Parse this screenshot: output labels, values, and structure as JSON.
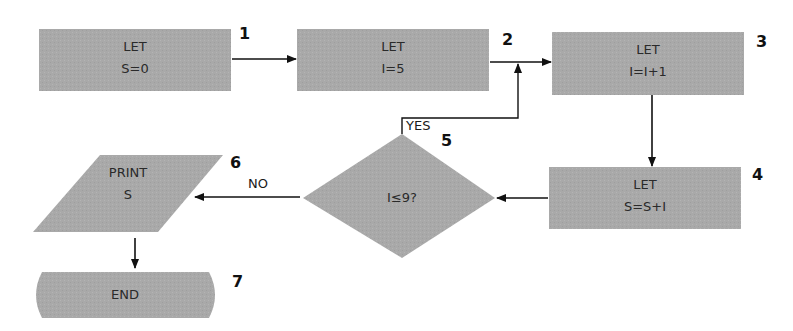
{
  "diagram": {
    "type": "flowchart",
    "fill_color": "#a9a9a9",
    "line_color": "#111111",
    "nodes": [
      {
        "id": "1",
        "shape": "rectangle",
        "line1": "LET",
        "line2": "S=0",
        "step": "1"
      },
      {
        "id": "2",
        "shape": "rectangle",
        "line1": "LET",
        "line2": "I=5",
        "step": "2"
      },
      {
        "id": "3",
        "shape": "rectangle",
        "line1": "LET",
        "line2": "I=I+1",
        "step": "3"
      },
      {
        "id": "4",
        "shape": "rectangle",
        "line1": "LET",
        "line2": "S=S+I",
        "step": "4"
      },
      {
        "id": "5",
        "shape": "diamond",
        "line1": "I≤9?",
        "step": "5"
      },
      {
        "id": "6",
        "shape": "parallelogram",
        "line1": "PRINT",
        "line2": "S",
        "step": "6"
      },
      {
        "id": "7",
        "shape": "terminator",
        "line1": "END",
        "step": "7"
      }
    ],
    "edges": [
      {
        "from": "1",
        "to": "2",
        "label": ""
      },
      {
        "from": "2",
        "to": "3",
        "label": ""
      },
      {
        "from": "3",
        "to": "4",
        "label": ""
      },
      {
        "from": "4",
        "to": "5",
        "label": ""
      },
      {
        "from": "5",
        "to": "3",
        "label": "YES"
      },
      {
        "from": "5",
        "to": "6",
        "label": "NO"
      },
      {
        "from": "6",
        "to": "7",
        "label": ""
      }
    ],
    "labels": {
      "yes": "YES",
      "no": "NO"
    }
  }
}
